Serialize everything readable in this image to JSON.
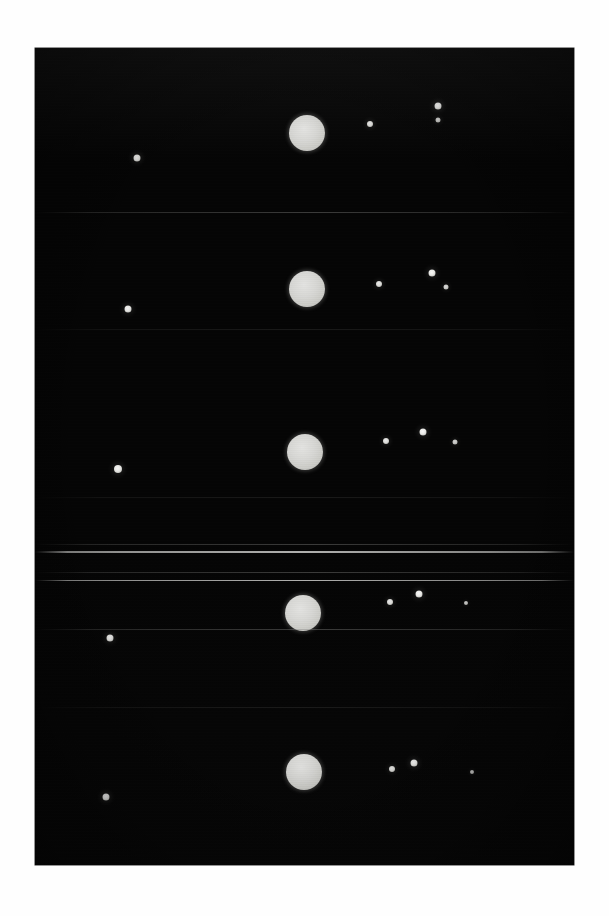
{
  "scene": {
    "title": "Jupiter and the four Galilean moons",
    "subtitle": "Five consecutive exposure bands on one photographic strip",
    "background_color": "#ffffff",
    "plate_color": "#050505",
    "disk_color": "#d5d5d2",
    "moon_color": "#f2f2ef",
    "plate": {
      "x": 35,
      "y": 48,
      "width": 539,
      "height": 817
    }
  },
  "chart_data": {
    "type": "scatter",
    "xlabel": "",
    "ylabel": "",
    "xlim": [
      35,
      574
    ],
    "ylim": [
      48,
      865
    ],
    "grid": false,
    "legend": "none",
    "annotations": [
      "Five stacked exposure bands recorded on successive nights",
      "Bright central disk is Jupiter; small points are the Galilean satellites",
      "Faint horizontal streaks are film splice and scan artifacts"
    ],
    "series": [
      {
        "name": "Band 1",
        "points": [
          {
            "label": "moon-west-outer",
            "x": 137,
            "y": 158,
            "size": 7,
            "brightness": 0.92
          },
          {
            "label": "jupiter",
            "x": 307,
            "y": 133,
            "size": 36,
            "brightness": 1.0
          },
          {
            "label": "moon-east-inner",
            "x": 370,
            "y": 124,
            "size": 6,
            "brightness": 0.85
          },
          {
            "label": "moon-east-upper",
            "x": 438,
            "y": 106,
            "size": 7,
            "brightness": 0.95
          },
          {
            "label": "moon-east-lower",
            "x": 438,
            "y": 120,
            "size": 5,
            "brightness": 0.7
          }
        ]
      },
      {
        "name": "Band 2",
        "points": [
          {
            "label": "moon-west-outer",
            "x": 128,
            "y": 309,
            "size": 7,
            "brightness": 0.92
          },
          {
            "label": "jupiter",
            "x": 307,
            "y": 289,
            "size": 36,
            "brightness": 1.0
          },
          {
            "label": "moon-east-inner",
            "x": 379,
            "y": 284,
            "size": 6,
            "brightness": 0.85
          },
          {
            "label": "moon-east-upper",
            "x": 432,
            "y": 273,
            "size": 7,
            "brightness": 0.95
          },
          {
            "label": "moon-east-lower",
            "x": 446,
            "y": 287,
            "size": 5,
            "brightness": 0.72
          }
        ]
      },
      {
        "name": "Band 3",
        "points": [
          {
            "label": "moon-west-outer",
            "x": 118,
            "y": 469,
            "size": 8,
            "brightness": 0.94
          },
          {
            "label": "jupiter",
            "x": 305,
            "y": 452,
            "size": 36,
            "brightness": 1.0
          },
          {
            "label": "moon-east-inner",
            "x": 386,
            "y": 441,
            "size": 6,
            "brightness": 0.86
          },
          {
            "label": "moon-east-upper",
            "x": 423,
            "y": 432,
            "size": 7,
            "brightness": 0.96
          },
          {
            "label": "moon-east-outer",
            "x": 455,
            "y": 442,
            "size": 5,
            "brightness": 0.68
          }
        ]
      },
      {
        "name": "Band 4",
        "points": [
          {
            "label": "moon-west-outer",
            "x": 110,
            "y": 638,
            "size": 7,
            "brightness": 0.92
          },
          {
            "label": "jupiter",
            "x": 303,
            "y": 613,
            "size": 36,
            "brightness": 1.0
          },
          {
            "label": "moon-east-inner",
            "x": 390,
            "y": 602,
            "size": 6,
            "brightness": 0.84
          },
          {
            "label": "moon-east-upper",
            "x": 419,
            "y": 594,
            "size": 7,
            "brightness": 0.96
          },
          {
            "label": "moon-east-outer",
            "x": 466,
            "y": 603,
            "size": 4,
            "brightness": 0.6
          }
        ]
      },
      {
        "name": "Band 5",
        "points": [
          {
            "label": "moon-west-outer",
            "x": 106,
            "y": 797,
            "size": 7,
            "brightness": 0.92
          },
          {
            "label": "jupiter",
            "x": 304,
            "y": 772,
            "size": 36,
            "brightness": 1.0
          },
          {
            "label": "moon-east-inner",
            "x": 392,
            "y": 769,
            "size": 6,
            "brightness": 0.84
          },
          {
            "label": "moon-east-upper",
            "x": 414,
            "y": 763,
            "size": 7,
            "brightness": 0.96
          },
          {
            "label": "moon-east-outer",
            "x": 472,
            "y": 772,
            "size": 4,
            "brightness": 0.58
          }
        ]
      }
    ],
    "artifacts": [
      {
        "label": "splice-line-1",
        "y": 212,
        "height": 1,
        "intensity": "faint"
      },
      {
        "label": "splice-line-2",
        "y": 329,
        "height": 1,
        "intensity": "dim"
      },
      {
        "label": "splice-line-3",
        "y": 497,
        "height": 1,
        "intensity": "dim"
      },
      {
        "label": "splice-line-4",
        "y": 544,
        "height": 1,
        "intensity": "faint"
      },
      {
        "label": "splice-line-5",
        "y": 551,
        "height": 2,
        "intensity": "bright"
      },
      {
        "label": "splice-line-6",
        "y": 572,
        "height": 1,
        "intensity": "faint"
      },
      {
        "label": "splice-line-7",
        "y": 580,
        "height": 1,
        "intensity": "bright"
      },
      {
        "label": "splice-line-8",
        "y": 629,
        "height": 1,
        "intensity": "faint"
      },
      {
        "label": "splice-line-9",
        "y": 707,
        "height": 1,
        "intensity": "dim"
      }
    ]
  }
}
